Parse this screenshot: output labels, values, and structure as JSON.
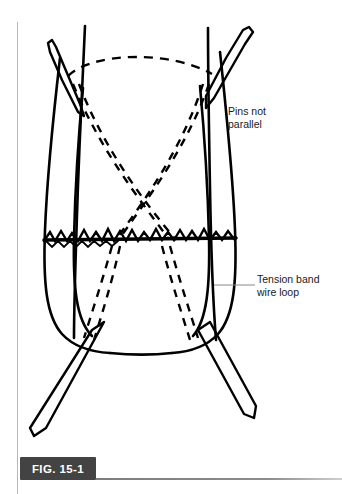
{
  "figure": {
    "caption_label": "FIG. 15-1",
    "callouts": [
      {
        "name": "pins-not-parallel",
        "text": "Pins not\nparallel",
        "x": 228,
        "y": 105,
        "leader": false
      },
      {
        "name": "tension-band-wire-loop",
        "text": "Tension band\nwire loop",
        "x": 257,
        "y": 273,
        "leader": true,
        "leader_from_x": 214,
        "leader_to_x": 255,
        "leader_y": 285
      }
    ],
    "colors": {
      "ink": "#000000",
      "page_background": "#ffffff",
      "caption_box": "#434343",
      "caption_text": "#ffffff",
      "margin_rule": "#b8b8b8",
      "leader_line": "#888888"
    },
    "elements": {
      "bone_outline_name": "patella-outline",
      "pin_left_name": "k-wire-pin-left",
      "pin_right_name": "k-wire-pin-right",
      "wire_band_name": "tension-band-zigzag-wire",
      "dashed_loop_name": "figure-eight-wire-dashed",
      "pin_count": 2
    }
  }
}
